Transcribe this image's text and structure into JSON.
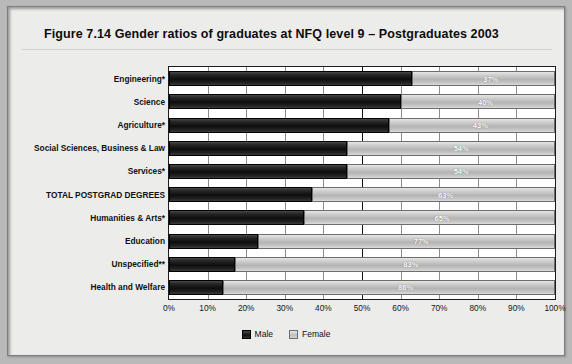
{
  "figure": {
    "title": "Figure 7.14   Gender ratios of graduates at NFQ level 9 – Postgraduates 2003"
  },
  "legend": {
    "male_label": "Male",
    "female_label": "Female"
  },
  "chart_data": {
    "type": "bar",
    "orientation": "horizontal",
    "stacked": true,
    "title": "Figure 7.14   Gender ratios of graduates at NFQ level 9 – Postgraduates 2003",
    "xlabel": "",
    "ylabel": "",
    "xlim": [
      0,
      100
    ],
    "xticks": [
      0,
      10,
      20,
      30,
      40,
      50,
      60,
      70,
      80,
      90,
      100
    ],
    "xtick_labels": [
      "0%",
      "10%",
      "20%",
      "30%",
      "40%",
      "50%",
      "60%",
      "70%",
      "80%",
      "90%",
      "100%"
    ],
    "grid": true,
    "reference_line": 50,
    "legend_position": "bottom-center",
    "categories": [
      "Engineering*",
      "Science",
      "Agriculture*",
      "Social Sciences, Business & Law",
      "Services*",
      "TOTAL POSTGRAD DEGREES",
      "Humanities & Arts*",
      "Education",
      "Unspecified**",
      "Health and Welfare"
    ],
    "series": [
      {
        "name": "Male",
        "values": [
          63,
          60,
          57,
          46,
          46,
          37,
          35,
          23,
          17,
          14
        ]
      },
      {
        "name": "Female",
        "values": [
          37,
          40,
          43,
          54,
          54,
          63,
          65,
          77,
          83,
          86
        ]
      }
    ],
    "data_labels": [
      "37%",
      "40%",
      "43%",
      "54%",
      "54%",
      "63%",
      "65%",
      "77%",
      "83%",
      "86%"
    ]
  }
}
